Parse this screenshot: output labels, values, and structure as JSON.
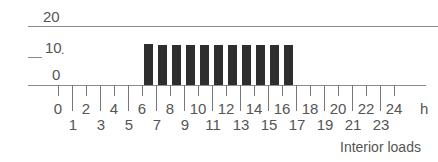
{
  "chart_data": {
    "type": "bar",
    "title": "",
    "caption": "Interior loads",
    "xlabel": "h",
    "ylabel": "",
    "ylim": [
      0,
      20
    ],
    "yticks": [
      "0",
      "10",
      "20"
    ],
    "xticks": [
      "0",
      "1",
      "2",
      "3",
      "4",
      "5",
      "6",
      "7",
      "8",
      "9",
      "10",
      "11",
      "12",
      "13",
      "14",
      "15",
      "16",
      "17",
      "18",
      "19",
      "20",
      "21",
      "22",
      "23",
      "24"
    ],
    "categories": [
      "6-7",
      "7-8",
      "8-9",
      "9-10",
      "10-11",
      "11-12",
      "12-13",
      "13-14",
      "14-15",
      "15-16",
      "16-17"
    ],
    "values": [
      14,
      13.5,
      13.5,
      13.5,
      13.5,
      13.7,
      13.7,
      13.6,
      13.5,
      13.4,
      13.4
    ],
    "grid": false,
    "legend": null
  },
  "labels": {
    "y20": "20",
    "y10": "10",
    "y10_suffix": ".",
    "y0": "0",
    "unit": "h",
    "caption": "Interior loads"
  },
  "colors": {
    "bar": "#2e2e2e",
    "axis": "#8a8a8a",
    "text": "#555555"
  }
}
